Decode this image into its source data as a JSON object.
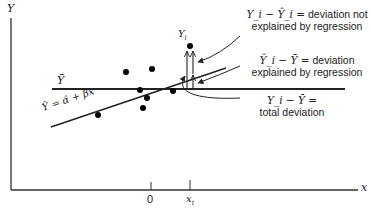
{
  "diagram": {
    "axes": {
      "y_label": "Y",
      "x_label": "x",
      "x_ticks": [
        {
          "label": "0",
          "x": 151
        },
        {
          "label": "x_i",
          "x": 190
        }
      ]
    },
    "lines": {
      "mean_line_label": "Ȳ",
      "regression_line_label": "Ŷ = α̂ + β̂x"
    },
    "point_label": "Y_i",
    "annotations": [
      {
        "id": "unexplained",
        "formula": "Y_i − Ŷ_i =",
        "line1": "deviation not",
        "line2": "explained by regression"
      },
      {
        "id": "explained",
        "formula": "Ŷ_i − Ȳ =",
        "line1": "deviation",
        "line2": "explained by regression"
      },
      {
        "id": "total",
        "formula": "Y_i − Ȳ =",
        "line1": "",
        "line2": "total deviation"
      }
    ],
    "points": [
      {
        "x": 98,
        "y": 115
      },
      {
        "x": 126,
        "y": 72
      },
      {
        "x": 140,
        "y": 90
      },
      {
        "x": 143,
        "y": 108
      },
      {
        "x": 147,
        "y": 98
      },
      {
        "x": 152,
        "y": 69
      },
      {
        "x": 173,
        "y": 91
      },
      {
        "x": 190,
        "y": 46
      }
    ],
    "colors": {
      "ink": "#222222",
      "background": "#ffffff"
    }
  }
}
